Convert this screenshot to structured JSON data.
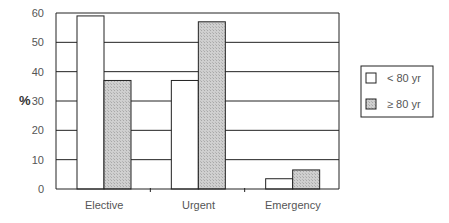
{
  "chart_data": {
    "type": "bar",
    "title": "",
    "xlabel": "",
    "ylabel": "%",
    "ylim": [
      0,
      60
    ],
    "yticks": [
      0,
      10,
      20,
      30,
      40,
      50,
      60
    ],
    "grid": true,
    "legend_position": "right",
    "categories": [
      "Elective",
      "Urgent",
      "Emergency"
    ],
    "series": [
      {
        "name": "< 80 yr",
        "color": "#ffffff",
        "values": [
          59,
          37,
          3.5
        ]
      },
      {
        "name": "≥ 80 yr",
        "color": "#c8c8c8",
        "values": [
          37,
          57,
          6.5
        ]
      }
    ]
  },
  "legend": {
    "items": [
      {
        "label": "< 80 yr"
      },
      {
        "label": "≥ 80 yr"
      }
    ]
  },
  "colors": {
    "axis": "#222222",
    "grid": "#222222",
    "series_light": "#ffffff",
    "series_dark": "#c8c8c8"
  }
}
